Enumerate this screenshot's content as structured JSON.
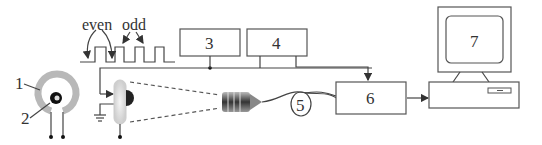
{
  "diagram": {
    "labels": {
      "coil_outer": "1",
      "coil_inner": "2",
      "block3": "3",
      "block4": "4",
      "fiber": "5",
      "block6": "6",
      "computer": "7"
    },
    "waveform": {
      "even_label": "even",
      "odd_label": "odd"
    },
    "colors": {
      "line": "#444444",
      "ring": "#b8b8b8",
      "background": "#ffffff"
    }
  }
}
